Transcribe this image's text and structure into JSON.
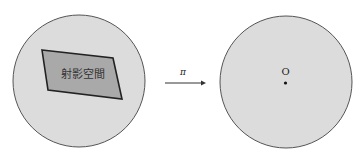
{
  "diagram": {
    "left": {
      "shape": "circle",
      "region_label": "射影空間",
      "fill": "#dcdcdc",
      "region_fill": "#a9a9a9"
    },
    "arrow": {
      "label": "π",
      "direction": "right"
    },
    "right": {
      "shape": "circle",
      "point_label": "O",
      "fill": "#dcdcdc"
    },
    "colors": {
      "stroke": "#555555",
      "dark_stroke": "#222222"
    }
  }
}
